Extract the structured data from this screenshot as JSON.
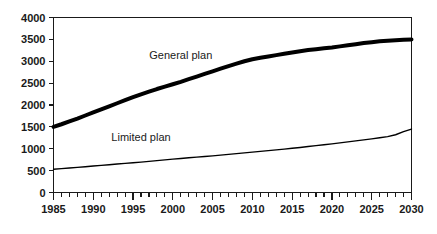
{
  "chart_data": {
    "type": "line",
    "title": "",
    "subtitle": "",
    "xlabel": "",
    "ylabel": "",
    "xlim": [
      1985,
      2030
    ],
    "ylim": [
      0,
      4000
    ],
    "grid": false,
    "legend_position": "inline-annotation",
    "x": [
      1985,
      1986,
      1987,
      1988,
      1989,
      1990,
      1991,
      1992,
      1993,
      1994,
      1995,
      1996,
      1997,
      1998,
      1999,
      2000,
      2001,
      2002,
      2003,
      2004,
      2005,
      2006,
      2007,
      2008,
      2009,
      2010,
      2011,
      2012,
      2013,
      2014,
      2015,
      2016,
      2017,
      2018,
      2019,
      2020,
      2021,
      2022,
      2023,
      2024,
      2025,
      2026,
      2027,
      2028,
      2029,
      2030
    ],
    "x_tick_labels": [
      "1985",
      "1990",
      "1995",
      "2000",
      "2005",
      "2010",
      "2015",
      "2020",
      "2025",
      "2030"
    ],
    "x_tick_values": [
      1985,
      1990,
      1995,
      2000,
      2005,
      2010,
      2015,
      2020,
      2025,
      2030
    ],
    "x_minor_tick_step": 1,
    "y_tick_labels": [
      "0",
      "500",
      "1000",
      "1500",
      "2000",
      "2500",
      "3000",
      "3500",
      "4000"
    ],
    "y_tick_values": [
      0,
      500,
      1000,
      1500,
      2000,
      2500,
      3000,
      3500,
      4000
    ],
    "series": [
      {
        "name": "General plan",
        "label": "General plan",
        "color": "#000000",
        "line_width": 4,
        "label_x": 2001,
        "label_y": 3050,
        "values": [
          1500,
          1560,
          1625,
          1690,
          1760,
          1830,
          1900,
          1970,
          2040,
          2110,
          2180,
          2245,
          2305,
          2365,
          2420,
          2475,
          2530,
          2590,
          2650,
          2710,
          2770,
          2830,
          2890,
          2945,
          3000,
          3045,
          3080,
          3110,
          3140,
          3170,
          3200,
          3230,
          3255,
          3275,
          3295,
          3315,
          3340,
          3365,
          3390,
          3415,
          3435,
          3455,
          3470,
          3482,
          3492,
          3500
        ]
      },
      {
        "name": "Limited plan",
        "label": "Limited plan",
        "color": "#000000",
        "line_width": 1.4,
        "label_x": 1996,
        "label_y": 1180,
        "values": [
          530,
          545,
          560,
          575,
          590,
          605,
          620,
          635,
          650,
          665,
          680,
          695,
          712,
          728,
          745,
          762,
          778,
          793,
          808,
          822,
          838,
          855,
          872,
          888,
          905,
          922,
          940,
          958,
          975,
          992,
          1010,
          1030,
          1050,
          1072,
          1092,
          1112,
          1135,
          1158,
          1180,
          1202,
          1225,
          1250,
          1278,
          1320,
          1390,
          1450
        ]
      }
    ]
  }
}
